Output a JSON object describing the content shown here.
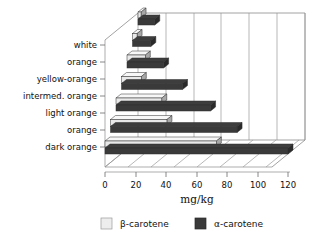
{
  "chart_data": {
    "type": "bar",
    "orientation": "horizontal",
    "style": "3d-grouped-horizontal-bar",
    "title": "",
    "subtitle": "",
    "xlabel": "mg/kg",
    "ylabel": "",
    "xlim": [
      0,
      130
    ],
    "xticks": [
      0,
      20,
      40,
      60,
      80,
      100,
      120
    ],
    "xtick_labels": [
      "0",
      "20",
      "40",
      "60",
      "80",
      "100",
      "120"
    ],
    "grid": true,
    "grid_axis": "x",
    "legend_position": "bottom",
    "categories": [
      "white",
      "orange",
      "yellow-orange",
      "intermed. orange",
      "light orange",
      "orange",
      "dark orange"
    ],
    "series": [
      {
        "name": "β-carotene",
        "color": "#e9e9e9",
        "values": [
          2,
          3,
          12,
          13,
          30,
          37,
          73
        ]
      },
      {
        "name": "α-carotene",
        "color": "#3a3a3a",
        "values": [
          11,
          12,
          24,
          40,
          62,
          83,
          120
        ]
      }
    ]
  },
  "axis": {
    "x_title": "mg/kg",
    "tick_labels": [
      "0",
      "20",
      "40",
      "60",
      "80",
      "100",
      "120"
    ]
  },
  "categories": [
    {
      "label": "white"
    },
    {
      "label": "orange"
    },
    {
      "label": "yellow-orange"
    },
    {
      "label": "intermed. orange"
    },
    {
      "label": "light orange"
    },
    {
      "label": "orange"
    },
    {
      "label": "dark orange"
    }
  ],
  "legend": {
    "items": [
      {
        "label": "β-carotene",
        "swatch": "#e9e9e9"
      },
      {
        "label": "α-carotene",
        "swatch": "#3a3a3a"
      }
    ]
  },
  "colors": {
    "beta_carotene": "#e9e9e9",
    "alpha_carotene": "#3a3a3a",
    "grid": "#9a9a9a",
    "axis": "#8a8a8a",
    "text": "#111111",
    "background": "#ffffff"
  }
}
